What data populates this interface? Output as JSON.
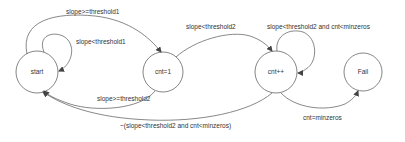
{
  "diagram": {
    "type": "state-machine",
    "colors": {
      "stroke": "#555555",
      "text": "#333333",
      "background": "#ffffff"
    },
    "states": [
      {
        "id": "start",
        "label": "start",
        "cx": 37,
        "cy": 72,
        "r": 21
      },
      {
        "id": "cnt1",
        "label": "cnt=1",
        "cx": 163,
        "cy": 72,
        "r": 20
      },
      {
        "id": "cntpp",
        "label": "cnt++",
        "cx": 276,
        "cy": 72,
        "r": 21
      },
      {
        "id": "fail",
        "label": "Fail",
        "cx": 363,
        "cy": 72,
        "r": 19
      }
    ],
    "transitions": [
      {
        "from": "start",
        "to": "cnt1",
        "label": "slope>=threshold1"
      },
      {
        "from": "start",
        "to": "start",
        "label": "slope<threshold1"
      },
      {
        "from": "cnt1",
        "to": "cntpp",
        "label": "slope<threshold2"
      },
      {
        "from": "cntpp",
        "to": "cntpp",
        "label": "slope<threshold2 and cnt<minzeros"
      },
      {
        "from": "cnt1",
        "to": "start",
        "label": "slope>=threshold2"
      },
      {
        "from": "cntpp",
        "to": "start",
        "label": "~(slope<threshold2 and cnt<minzeros)"
      },
      {
        "from": "cntpp",
        "to": "fail",
        "label": "cnt=minzeros"
      }
    ]
  }
}
